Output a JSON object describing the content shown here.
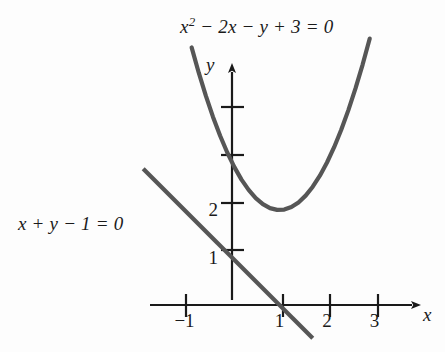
{
  "figure": {
    "background_color": "#fdfdfd",
    "curve_color": "#565656",
    "axis_color": "#1a1a1a",
    "text_color": "#1a1a1a"
  },
  "labels": {
    "parabola_equation_base": "x",
    "parabola_equation_exponent": "2",
    "parabola_equation_rest": " − 2x − y + 3 = 0",
    "line_equation": "x + y − 1 = 0",
    "axis_x_name": "x",
    "axis_y_name": "y"
  },
  "chart_data": {
    "type": "line",
    "title": "",
    "xlabel": "x",
    "ylabel": "y",
    "xlim": [
      -1.8,
      3.6
    ],
    "ylim": [
      -0.8,
      4.6
    ],
    "grid": false,
    "legend_position": "none",
    "x_ticks": [
      {
        "value": -1,
        "label": "−1"
      },
      {
        "value": 1,
        "label": "1"
      },
      {
        "value": 2,
        "label": "2"
      },
      {
        "value": 3,
        "label": "3"
      }
    ],
    "y_ticks": [
      {
        "value": 1,
        "label": "1"
      },
      {
        "value": 2,
        "label": "2"
      },
      {
        "value": 3,
        "label": ""
      },
      {
        "value": 4,
        "label": ""
      }
    ],
    "series": [
      {
        "name": "x² − 2x − y + 3 = 0",
        "kind": "parabola",
        "equation": "y = x^2 - 2x + 3",
        "vertex": [
          1,
          2
        ],
        "x_domain": [
          -0.85,
          2.9
        ],
        "points": [
          [
            -0.85,
            5.4225
          ],
          [
            -0.7,
            4.89
          ],
          [
            -0.55,
            4.4025
          ],
          [
            -0.4,
            3.96
          ],
          [
            -0.25,
            3.5625
          ],
          [
            -0.1,
            3.21
          ],
          [
            0.05,
            2.9025
          ],
          [
            0.2,
            2.64
          ],
          [
            0.35,
            2.4225
          ],
          [
            0.5,
            2.25
          ],
          [
            0.65,
            2.1225
          ],
          [
            0.8,
            2.04
          ],
          [
            0.95,
            2.0025
          ],
          [
            1.1,
            2.01
          ],
          [
            1.25,
            2.0625
          ],
          [
            1.4,
            2.16
          ],
          [
            1.55,
            2.3025
          ],
          [
            1.7,
            2.49
          ],
          [
            1.85,
            2.7225
          ],
          [
            2.0,
            3.0
          ],
          [
            2.15,
            3.3225
          ],
          [
            2.3,
            3.69
          ],
          [
            2.45,
            4.1025
          ],
          [
            2.6,
            4.56
          ],
          [
            2.75,
            5.0625
          ],
          [
            2.9,
            5.61
          ]
        ]
      },
      {
        "name": "x + y − 1 = 0",
        "kind": "line",
        "equation": "y = 1 - x",
        "x_domain": [
          -1.87,
          1.7
        ],
        "points": [
          [
            -1.87,
            2.87
          ],
          [
            1.7,
            -0.7
          ]
        ]
      }
    ],
    "intersections": [
      [
        1,
        0
      ],
      [
        0,
        1
      ]
    ]
  }
}
